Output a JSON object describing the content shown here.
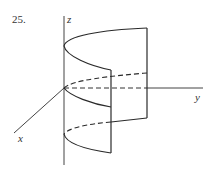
{
  "problem_number": "25.",
  "axes": {
    "x_label": "x",
    "y_label": "y",
    "z_label": "z"
  },
  "figure": {
    "line_color": "#2a2a2a",
    "axis_color": "#444444"
  }
}
